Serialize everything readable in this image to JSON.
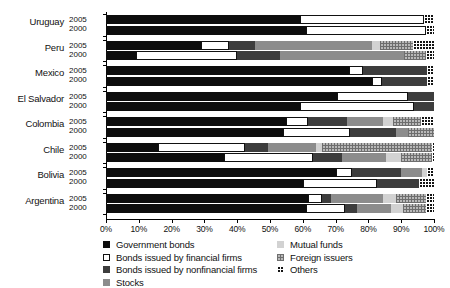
{
  "chart_data": {
    "type": "bar",
    "orientation": "horizontal",
    "stacked": true,
    "normalized": true,
    "title": "",
    "subtitle": "",
    "xlabel": "",
    "ylabel": "",
    "xlim": [
      0,
      100
    ],
    "grid": false,
    "legend_position": "bottom",
    "xticklabels": [
      "0%",
      "10%",
      "20%",
      "30%",
      "40%",
      "50%",
      "60%",
      "70%",
      "80%",
      "90%",
      "100%"
    ],
    "xtickvalues": [
      0,
      10,
      20,
      30,
      40,
      50,
      60,
      70,
      80,
      90,
      100
    ],
    "series": [
      {
        "name": "Government bonds",
        "key": "gov",
        "swatch": "solid-black",
        "color": "#0d0d0d"
      },
      {
        "name": "Bonds issued by financial firms",
        "key": "finbond",
        "swatch": "outline-white",
        "color": "#ffffff"
      },
      {
        "name": "Bonds issued by nonfinancial firms",
        "key": "nonfin",
        "swatch": "solid-darkgray",
        "color": "#3d3d3d"
      },
      {
        "name": "Stocks",
        "key": "stocks",
        "swatch": "solid-midgray",
        "color": "#8c8c8c"
      },
      {
        "name": "Mutual funds",
        "key": "mutual",
        "swatch": "solid-lightgray",
        "color": "#d2d2d2"
      },
      {
        "name": "Foreign issuers",
        "key": "foreign",
        "swatch": "checker-light",
        "color": "#b9b9b9"
      },
      {
        "name": "Others",
        "key": "others",
        "swatch": "checker-dark",
        "color": "#141414"
      }
    ],
    "countries": [
      {
        "name": "Uruguay",
        "rows": [
          {
            "year": "2005",
            "values": {
              "gov": 59.0,
              "finbond": 38.0,
              "nonfin": 0.0,
              "stocks": 0.0,
              "mutual": 0.0,
              "foreign": 0.0,
              "others": 3.0
            }
          },
          {
            "year": "2000",
            "values": {
              "gov": 61.0,
              "finbond": 36.5,
              "nonfin": 0.0,
              "stocks": 0.0,
              "mutual": 0.0,
              "foreign": 0.0,
              "others": 2.5
            }
          }
        ]
      },
      {
        "name": "Peru",
        "rows": [
          {
            "year": "2005",
            "values": {
              "gov": 29.0,
              "finbond": 8.5,
              "nonfin": 8.0,
              "stocks": 35.5,
              "mutual": 2.5,
              "foreign": 10.0,
              "others": 6.5
            }
          },
          {
            "year": "2000",
            "values": {
              "gov": 9.0,
              "finbond": 31.0,
              "nonfin": 13.0,
              "stocks": 38.0,
              "mutual": 0.0,
              "foreign": 6.5,
              "others": 2.5
            }
          }
        ]
      },
      {
        "name": "Mexico",
        "rows": [
          {
            "year": "2005",
            "values": {
              "gov": 74.0,
              "finbond": 4.5,
              "nonfin": 19.5,
              "stocks": 0.0,
              "mutual": 0.0,
              "foreign": 0.0,
              "others": 2.0
            }
          },
          {
            "year": "2000",
            "values": {
              "gov": 81.0,
              "finbond": 3.0,
              "nonfin": 14.0,
              "stocks": 0.0,
              "mutual": 0.0,
              "foreign": 0.0,
              "others": 2.0
            }
          }
        ]
      },
      {
        "name": "El Salvador",
        "rows": [
          {
            "year": "2005",
            "values": {
              "gov": 70.5,
              "finbond": 21.5,
              "nonfin": 8.0,
              "stocks": 0.0,
              "mutual": 0.0,
              "foreign": 0.0,
              "others": 0.0
            }
          },
          {
            "year": "2000",
            "values": {
              "gov": 59.0,
              "finbond": 35.0,
              "nonfin": 6.0,
              "stocks": 0.0,
              "mutual": 0.0,
              "foreign": 0.0,
              "others": 0.0
            }
          }
        ]
      },
      {
        "name": "Colombia",
        "rows": [
          {
            "year": "2005",
            "values": {
              "gov": 55.0,
              "finbond": 6.5,
              "nonfin": 12.0,
              "stocks": 11.0,
              "mutual": 3.0,
              "foreign": 8.5,
              "others": 4.0
            }
          },
          {
            "year": "2000",
            "values": {
              "gov": 54.0,
              "finbond": 20.5,
              "nonfin": 14.0,
              "stocks": 3.5,
              "mutual": 0.0,
              "foreign": 8.0,
              "others": 0.0
            }
          }
        ]
      },
      {
        "name": "Chile",
        "rows": [
          {
            "year": "2005",
            "values": {
              "gov": 16.0,
              "finbond": 26.5,
              "nonfin": 7.0,
              "stocks": 14.5,
              "mutual": 2.0,
              "foreign": 33.5,
              "others": 0.5
            }
          },
          {
            "year": "2000",
            "values": {
              "gov": 36.0,
              "finbond": 27.0,
              "nonfin": 9.0,
              "stocks": 13.5,
              "mutual": 4.5,
              "foreign": 9.5,
              "others": 0.5
            }
          }
        ]
      },
      {
        "name": "Bolivia",
        "rows": [
          {
            "year": "2005",
            "values": {
              "gov": 70.0,
              "finbond": 5.0,
              "nonfin": 15.0,
              "stocks": 6.5,
              "mutual": 1.5,
              "foreign": 0.0,
              "others": 2.0
            }
          },
          {
            "year": "2000",
            "values": {
              "gov": 60.0,
              "finbond": 22.5,
              "nonfin": 13.0,
              "stocks": 0.0,
              "mutual": 0.0,
              "foreign": 0.0,
              "others": 4.5
            }
          }
        ]
      },
      {
        "name": "Argentina",
        "rows": [
          {
            "year": "2005",
            "values": {
              "gov": 61.5,
              "finbond": 4.5,
              "nonfin": 2.5,
              "stocks": 16.0,
              "mutual": 4.0,
              "foreign": 9.0,
              "others": 2.5
            }
          },
          {
            "year": "2000",
            "values": {
              "gov": 61.0,
              "finbond": 12.0,
              "nonfin": 3.5,
              "stocks": 10.5,
              "mutual": 3.5,
              "foreign": 7.0,
              "others": 2.5
            }
          }
        ]
      }
    ]
  }
}
